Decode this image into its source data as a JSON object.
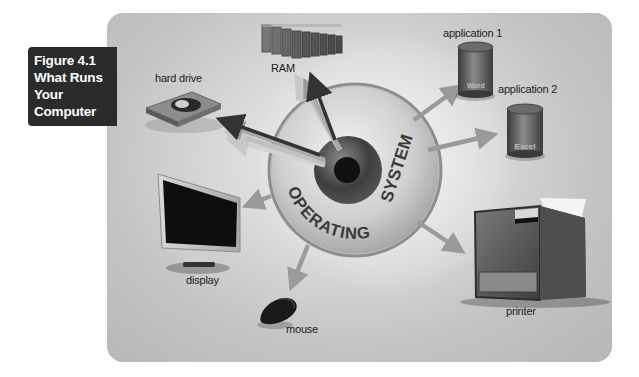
{
  "figure": {
    "number": "Figure 4.1",
    "title_lines": [
      "What Runs",
      "Your",
      "Computer"
    ]
  },
  "center": {
    "label_top": "SYSTEM",
    "label_bottom": "OPERATING",
    "full_label": "OPERATING SYSTEM"
  },
  "components": {
    "ram": "RAM",
    "hard_drive": "hard drive",
    "application_1": "application 1",
    "application_1_name": "Word",
    "application_2": "application 2",
    "application_2_name": "Excel",
    "display": "display",
    "mouse": "mouse",
    "printer": "printer"
  },
  "colors": {
    "label_box": "#2b2b2b",
    "panel": "#c8c8c8",
    "arrow_dark": "#333333",
    "arrow_light": "#9a9a9a",
    "disc_ring": "#a9a9a9"
  }
}
